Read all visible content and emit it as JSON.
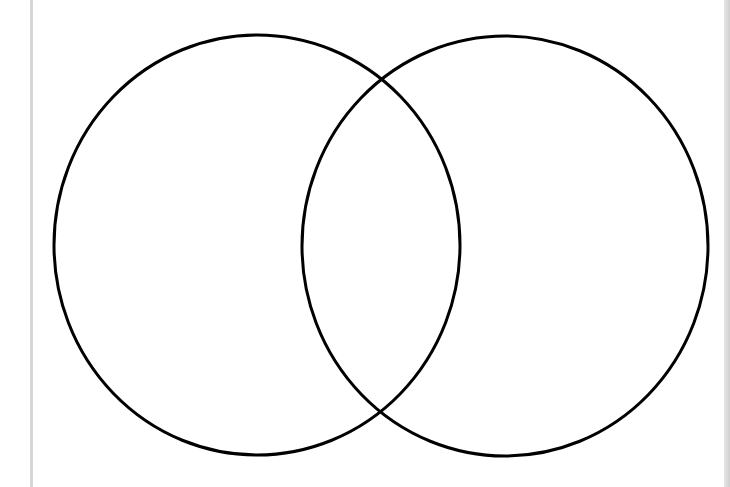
{
  "diagram": {
    "type": "venn",
    "sets": [
      {
        "name": "left-set",
        "label": "",
        "cx": 257,
        "cy": 245,
        "rx": 203,
        "ry": 210
      },
      {
        "name": "right-set",
        "label": "",
        "cx": 505,
        "cy": 246,
        "rx": 203,
        "ry": 210
      }
    ],
    "stroke_color": "#000000",
    "stroke_width": 3,
    "fill": "none",
    "background": "#ffffff",
    "intersection": {
      "top": [
        380,
        77
      ],
      "bottom": [
        380,
        410
      ]
    }
  }
}
